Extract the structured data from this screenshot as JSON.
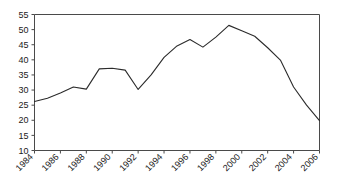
{
  "chart_data": {
    "type": "line",
    "title": "",
    "subtitle": "",
    "xlabel": "",
    "ylabel": "",
    "x": [
      1984,
      1985,
      1986,
      1987,
      1988,
      1989,
      1990,
      1991,
      1992,
      1993,
      1994,
      1995,
      1996,
      1997,
      1998,
      1999,
      2000,
      2001,
      2002,
      2003,
      2004,
      2005,
      2006
    ],
    "values": [
      26.2,
      27.3,
      29.0,
      31.0,
      30.3,
      37.0,
      37.2,
      36.6,
      30.2,
      35.0,
      40.8,
      44.6,
      46.7,
      44.2,
      47.5,
      51.4,
      49.6,
      47.8,
      44.0,
      39.8,
      31.0,
      25.0,
      19.9
    ],
    "series": [
      {
        "name": "series-1",
        "values": [
          26.2,
          27.3,
          29.0,
          31.0,
          30.3,
          37.0,
          37.2,
          36.6,
          30.2,
          35.0,
          40.8,
          44.6,
          46.7,
          44.2,
          47.5,
          51.4,
          49.6,
          47.8,
          44.0,
          39.8,
          31.0,
          25.0,
          19.9
        ],
        "color": "#2b2b2b"
      }
    ],
    "xlim": [
      1984,
      2006
    ],
    "ylim": [
      10,
      55
    ],
    "ytick_values": [
      10,
      15,
      20,
      25,
      30,
      35,
      40,
      45,
      50,
      55
    ],
    "ytick_labels": [
      "10",
      "15",
      "20",
      "25",
      "30",
      "35",
      "40",
      "45",
      "50",
      "55"
    ],
    "xtick_values": [
      1984,
      1986,
      1988,
      1990,
      1992,
      1994,
      1996,
      1998,
      2000,
      2002,
      2004,
      2006
    ],
    "xtick_labels": [
      "1984",
      "1986",
      "1988",
      "1990",
      "1992",
      "1994",
      "1996",
      "1998",
      "2000",
      "2002",
      "2004",
      "2006"
    ],
    "xtick_rotation": -45,
    "grid": false,
    "legend": false,
    "legend_position": "none",
    "annotations": [],
    "line_color": "#2b2b2b",
    "axis_color": "#4a4a4a",
    "background_color": "#ffffff"
  }
}
